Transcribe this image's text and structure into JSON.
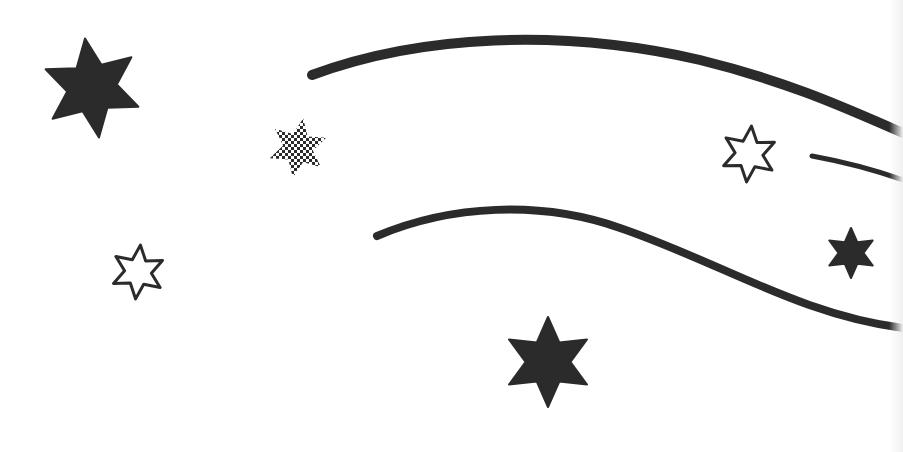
{
  "illustration": {
    "subject": "shooting stars with swooshes",
    "colors": {
      "ink": "#2b2b2b",
      "background": "#ffffff"
    },
    "stars": [
      {
        "name": "solid-star-large-top-left",
        "cx": 92,
        "cy": 88,
        "r": 50,
        "style": "solid",
        "rotation": -8
      },
      {
        "name": "checkered-star",
        "cx": 298,
        "cy": 148,
        "r": 30,
        "style": "checkered",
        "rotation": 10
      },
      {
        "name": "outline-star-left",
        "cx": 138,
        "cy": 272,
        "r": 27,
        "style": "outline",
        "rotation": 5
      },
      {
        "name": "outline-star-right",
        "cx": 749,
        "cy": 154,
        "r": 28,
        "style": "outline",
        "rotation": 5
      },
      {
        "name": "solid-star-small-right",
        "cx": 851,
        "cy": 253,
        "r": 25,
        "style": "solid",
        "rotation": 0
      },
      {
        "name": "solid-star-bottom-center",
        "cx": 548,
        "cy": 362,
        "r": 45,
        "style": "solid",
        "rotation": 0
      }
    ],
    "swooshes": [
      {
        "name": "top-swoosh",
        "path": "M312,75 C420,35 560,28 700,60 C790,82 850,110 903,133",
        "width": 10
      },
      {
        "name": "middle-dash",
        "path": "M812,156 C845,162 875,170 903,180",
        "width": 5
      },
      {
        "name": "bottom-swoosh",
        "path": "M377,236 C450,205 540,200 620,228 C720,262 800,315 903,328",
        "width": 8
      }
    ]
  }
}
